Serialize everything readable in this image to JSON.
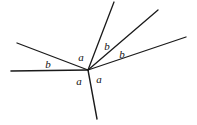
{
  "figure": {
    "background_color": "#ffffff",
    "stroke_color": "#1a1a1a",
    "label_color": "#111111",
    "width": 197,
    "height": 125
  },
  "vertex": {
    "label": "vertex",
    "x": 88,
    "y": 70
  },
  "rays": [
    {
      "name": "ray-horizontal-left",
      "description": "horizontal ray to the left",
      "x1": 88,
      "y1": 70,
      "x2": 11,
      "y2": 71,
      "stroke_width": 1.6
    },
    {
      "name": "ray-upper-left",
      "description": "shallow ray up and to the left",
      "x1": 88,
      "y1": 70,
      "x2": 17,
      "y2": 43,
      "stroke_width": 1.3
    },
    {
      "name": "ray-steep-up",
      "description": "steep ray up and slightly right",
      "x1": 88,
      "y1": 70,
      "x2": 114,
      "y2": 2,
      "stroke_width": 1.3
    },
    {
      "name": "ray-upper-right-diagonal",
      "description": "diagonal ray up and to the right",
      "x1": 88,
      "y1": 70,
      "x2": 158,
      "y2": 10,
      "stroke_width": 1.3
    },
    {
      "name": "ray-right-shallow",
      "description": "shallow ray to the upper right",
      "x1": 88,
      "y1": 70,
      "x2": 186,
      "y2": 37,
      "stroke_width": 1.3
    },
    {
      "name": "ray-down",
      "description": "ray going down and slightly right",
      "x1": 88,
      "y1": 70,
      "x2": 97,
      "y2": 119,
      "stroke_width": 1.4
    }
  ],
  "labels": [
    {
      "name": "angle-label-b-left",
      "text": "b",
      "x": 48,
      "y": 64
    },
    {
      "name": "angle-label-a-upper-left",
      "text": "a",
      "x": 81,
      "y": 57
    },
    {
      "name": "angle-label-b-upper-inner",
      "text": "b",
      "x": 107,
      "y": 46
    },
    {
      "name": "angle-label-b-upper-outer",
      "text": "b",
      "x": 122,
      "y": 54
    },
    {
      "name": "angle-label-a-lower-left",
      "text": "a",
      "x": 79,
      "y": 81
    },
    {
      "name": "angle-label-a-lower-right",
      "text": "a",
      "x": 99,
      "y": 79
    }
  ]
}
